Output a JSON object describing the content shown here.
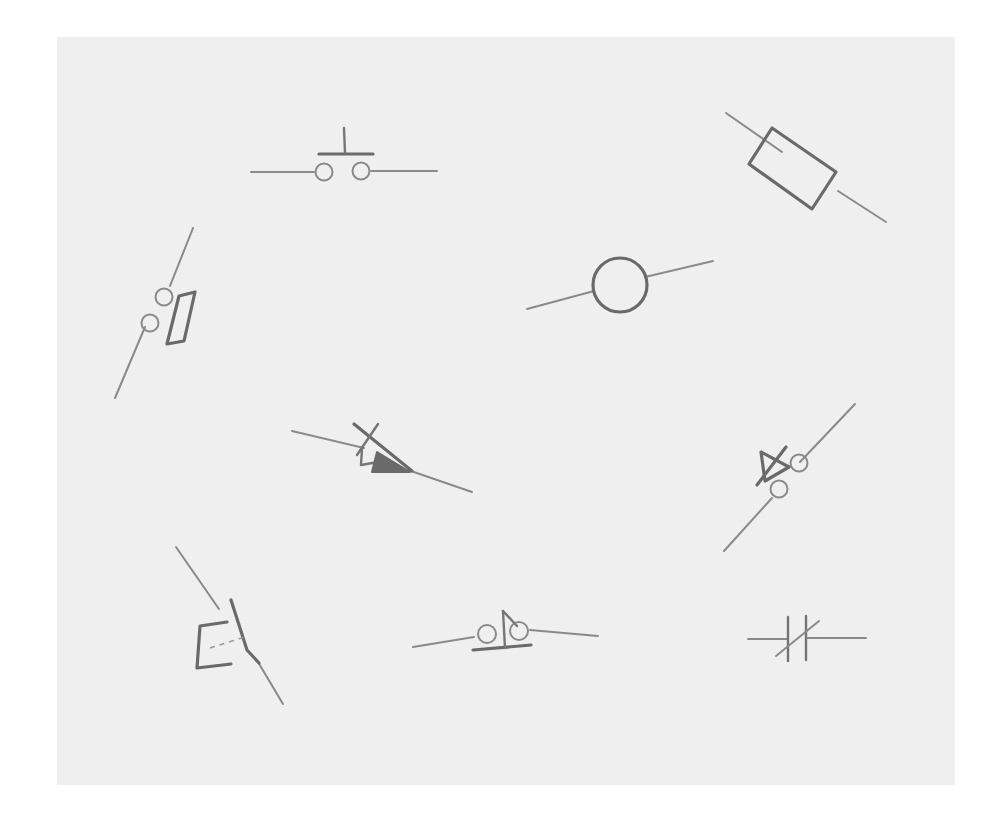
{
  "page": {
    "width": 1003,
    "height": 826,
    "background_color": "#ffffff"
  },
  "canvas": {
    "name": "sketch-sheet",
    "x": 57,
    "y": 37,
    "width": 898,
    "height": 748,
    "fill_color": "#f0f0f0",
    "stroke_color": "#6e6e6e",
    "lead_color": "#8a8a8a"
  },
  "symbols": [
    {
      "id": "pushbutton-top",
      "label": "Pushbutton switch",
      "position": "top-center",
      "orientation": "horizontal",
      "terminals": 2,
      "features": [
        "two terminal circles",
        "horizontal actuator bar",
        "vertical plunger stem",
        "two horizontal leads"
      ]
    },
    {
      "id": "resistor-top-right",
      "label": "Resistor",
      "position": "top-right",
      "orientation": "diagonal-down-right",
      "terminals": 2,
      "features": [
        "rotated rectangle body",
        "two diagonal leads"
      ]
    },
    {
      "id": "switch-left",
      "label": "Switch with contact blade",
      "position": "left",
      "orientation": "diagonal-up-right",
      "terminals": 2,
      "features": [
        "two terminal circles",
        "narrow rectangular contact blade",
        "two diagonal leads"
      ]
    },
    {
      "id": "lamp-center-right",
      "label": "Lamp / source",
      "position": "center-right",
      "orientation": "diagonal-up-right",
      "terminals": 2,
      "features": [
        "open circle body",
        "two diagonal leads"
      ]
    },
    {
      "id": "diode-center",
      "label": "Diode with crossed cathode bar",
      "position": "center",
      "orientation": "diagonal-down-right",
      "terminals": 2,
      "features": [
        "filled triangle anode",
        "crossed cathode bar",
        "two diagonal leads"
      ]
    },
    {
      "id": "diode-right",
      "label": "Diode with terminals",
      "position": "right",
      "orientation": "diagonal-up-right",
      "terminals": 2,
      "features": [
        "triangle anode",
        "cathode bar",
        "two terminal circles",
        "two diagonal leads"
      ]
    },
    {
      "id": "relay-bottom-left",
      "label": "Relay with coil and dashed linkage",
      "position": "bottom-left",
      "orientation": "diagonal",
      "terminals": 2,
      "features": [
        "C-shaped coil bracket",
        "dashed mechanical linkage",
        "switch arm",
        "two diagonal leads"
      ]
    },
    {
      "id": "pushbutton-bottom",
      "label": "Pushbutton switch",
      "position": "bottom-center",
      "orientation": "slight-diagonal",
      "terminals": 2,
      "features": [
        "two terminal circles",
        "horizontal actuator bar",
        "angled plunger stem",
        "two leads"
      ]
    },
    {
      "id": "capacitor-bottom-right",
      "label": "Variable capacitor",
      "position": "bottom-right",
      "orientation": "horizontal",
      "terminals": 2,
      "features": [
        "two parallel vertical plates",
        "diagonal variability slash",
        "two horizontal leads"
      ]
    }
  ]
}
